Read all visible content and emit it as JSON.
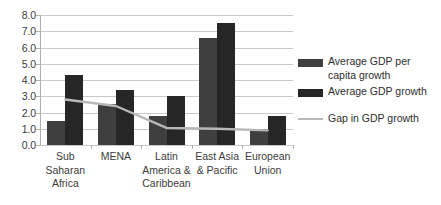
{
  "chart_data": {
    "type": "bar",
    "title": "",
    "subtitle": "",
    "xlabel": "",
    "ylabel": "",
    "ylim": [
      0.0,
      8.0
    ],
    "y_tick_step": 1.0,
    "grid": true,
    "legend_position": "right",
    "categories": [
      "Sub\nSaharan\nAfrica",
      "MENA",
      "Latin\nAmerica &\nCaribbean",
      "East Asia\n& Pacific",
      "European\nUnion"
    ],
    "y_tick_labels": [
      "8.0",
      "7.0",
      "6.0",
      "5.0",
      "4.0",
      "3.0",
      "2.0",
      "1.0",
      "0.0"
    ],
    "y_tick_values": [
      8.0,
      7.0,
      6.0,
      5.0,
      4.0,
      3.0,
      2.0,
      1.0,
      0.0
    ],
    "series": [
      {
        "name": "Average GDP per capita growth",
        "type": "bar",
        "color": "#3f3f3f",
        "values": [
          1.5,
          2.5,
          1.8,
          6.6,
          1.0
        ]
      },
      {
        "name": "Average GDP growth",
        "type": "bar",
        "color": "#262626",
        "values": [
          4.3,
          3.4,
          3.0,
          7.5,
          1.8
        ]
      },
      {
        "name": "Gap in GDP growth",
        "type": "line",
        "color": "#b8b8b8",
        "values": [
          2.8,
          2.4,
          1.05,
          1.0,
          0.9
        ]
      }
    ]
  },
  "legend": {
    "items": [
      {
        "label": "Average GDP per capita growth",
        "swatch": "bar-swatch-dark-gray"
      },
      {
        "label": "Average GDP growth",
        "swatch": "bar-swatch-black"
      },
      {
        "label": "Gap in GDP growth",
        "swatch": "line-swatch-light-gray"
      }
    ]
  }
}
